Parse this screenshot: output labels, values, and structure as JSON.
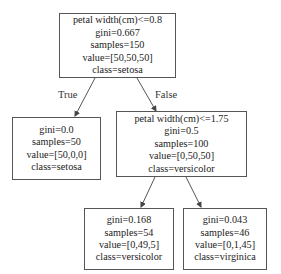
{
  "diagram": {
    "type": "decision-tree",
    "nodes": {
      "root": {
        "condition": "petal width(cm)<=0.8",
        "gini": "gini=0.667",
        "samples": "samples=150",
        "value": "value=[50,50,50]",
        "class": "class=setosa"
      },
      "left_leaf": {
        "gini": "gini=0.0",
        "samples": "samples=50",
        "value": "value=[50,0,0]",
        "class": "class=setosa"
      },
      "right_split": {
        "condition": "petal width(cm)<=1.75",
        "gini": "gini=0.5",
        "samples": "samples=100",
        "value": "value=[0,50,50]",
        "class": "class=versicolor"
      },
      "right_left_leaf": {
        "gini": "gini=0.168",
        "samples": "samples=54",
        "value": "value=[0,49,5]",
        "class": "class=versicolor"
      },
      "right_right_leaf": {
        "gini": "gini=0.043",
        "samples": "samples=46",
        "value": "value=[0,1,45]",
        "class": "class=virginica"
      }
    },
    "edge_labels": {
      "true": "True",
      "false": "False"
    },
    "colors": {
      "border": "#555555",
      "arrow": "#444444",
      "text": "#222222",
      "background": "#ffffff"
    }
  }
}
